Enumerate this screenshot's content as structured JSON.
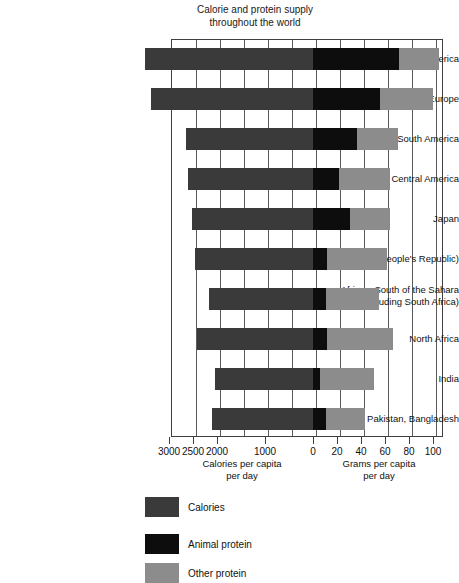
{
  "chart_data": {
    "type": "bar",
    "title": "Calorie and protein supply throughout the world",
    "title_line1": "Calorie and protein supply",
    "title_line2": "throughout the world",
    "orientation": "horizontal",
    "layout": "back-to-back diverging stacked bars",
    "grid": true,
    "legend_position": "bottom-left",
    "categories": [
      "North America",
      "Western Europe",
      "South America",
      "Central America",
      "Japan",
      "China (People's Republic)",
      "Africa—South of the Sahara (excluding South Africa)",
      "North Africa",
      "India",
      "Pakistan, Bangladesh"
    ],
    "category_lines": [
      [
        "North America"
      ],
      [
        "Western Europe"
      ],
      [
        "South America"
      ],
      [
        "Central America"
      ],
      [
        "Japan"
      ],
      [
        "China (People's Republic)"
      ],
      [
        "Africa—South of the Sahara",
        "(excluding South Africa)"
      ],
      [
        "North Africa"
      ],
      [
        "India"
      ],
      [
        "Pakistan, Bangladesh"
      ]
    ],
    "left_axis": {
      "label_line1": "Calories per capita",
      "label_line2": "per day",
      "ticks": [
        3000,
        2500,
        2000,
        1000,
        0
      ],
      "direction": "right-to-left",
      "max": 3000
    },
    "right_axis": {
      "label_line1": "Grams per capita",
      "label_line2": "per day",
      "ticks": [
        0,
        20,
        40,
        60,
        80,
        100
      ],
      "direction": "left-to-right",
      "max": 120
    },
    "series": [
      {
        "name": "Calories",
        "color": "#3a3a3a",
        "unit": "calories per capita per day",
        "axis": "left",
        "values": [
          3500,
          3380,
          2650,
          2600,
          2520,
          2460,
          2160,
          2420,
          2040,
          2100
        ]
      },
      {
        "name": "Animal protein",
        "color": "#0d0d0d",
        "unit": "grams per capita per day",
        "axis": "right",
        "values": [
          72,
          56,
          37,
          22,
          31,
          12,
          11,
          12,
          6,
          11
        ]
      },
      {
        "name": "Other protein",
        "color": "#8c8c8c",
        "unit": "grams per capita per day",
        "axis": "right",
        "values": [
          33,
          44,
          34,
          42,
          33,
          50,
          44,
          55,
          45,
          32
        ]
      }
    ],
    "legend": [
      {
        "label": "Calories",
        "color": "#3a3a3a"
      },
      {
        "label": "Animal protein",
        "color": "#0d0d0d"
      },
      {
        "label": "Other protein",
        "color": "#8c8c8c"
      }
    ]
  }
}
